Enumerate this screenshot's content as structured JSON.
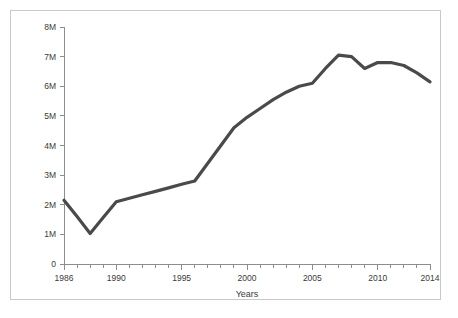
{
  "figure": {
    "background_color": "#ffffff",
    "frame_color": "#c9c9c9",
    "axis_color": "#8d8d8d"
  },
  "chart_data": {
    "type": "line",
    "title": "",
    "subtitle": "",
    "xlabel": "Years",
    "ylabel": "",
    "xlim": [
      1986,
      2014
    ],
    "ylim": [
      0,
      8000000
    ],
    "grid": false,
    "legend": "none",
    "line_color": "#4a4a4a",
    "line_width": 3.2,
    "x_tick_labels": [
      "1986",
      "1990",
      "1995",
      "2000",
      "2005",
      "2010",
      "2014"
    ],
    "x_tick_label_values": [
      1986,
      1990,
      1995,
      2000,
      2005,
      2010,
      2014
    ],
    "x_minor_ticks_every": 1,
    "y_tick_labels": [
      "0",
      "1M",
      "2M",
      "3M",
      "4M",
      "5M",
      "6M",
      "7M",
      "8M"
    ],
    "y_tick_values": [
      0,
      1000000,
      2000000,
      3000000,
      4000000,
      5000000,
      6000000,
      7000000,
      8000000
    ],
    "x": [
      1986,
      1987,
      1988,
      1989,
      1990,
      1991,
      1992,
      1993,
      1994,
      1995,
      1996,
      1997,
      1998,
      1999,
      2000,
      2001,
      2002,
      2003,
      2004,
      2005,
      2006,
      2007,
      2008,
      2009,
      2010,
      2011,
      2012,
      2013,
      2014
    ],
    "values": [
      2150000,
      1600000,
      1030000,
      1570000,
      2100000,
      2220000,
      2340000,
      2450000,
      2570000,
      2690000,
      2800000,
      3400000,
      4000000,
      4600000,
      4950000,
      5250000,
      5550000,
      5800000,
      6000000,
      6100000,
      6600000,
      7050000,
      7000000,
      6600000,
      6800000,
      6800000,
      6700000,
      6450000,
      6150000
    ],
    "series": [
      {
        "name": "Series 1",
        "color": "#4a4a4a",
        "values": [
          2150000,
          1600000,
          1030000,
          1570000,
          2100000,
          2220000,
          2340000,
          2450000,
          2570000,
          2690000,
          2800000,
          3400000,
          4000000,
          4600000,
          4950000,
          5250000,
          5550000,
          5800000,
          6000000,
          6100000,
          6600000,
          7050000,
          7000000,
          6600000,
          6800000,
          6800000,
          6700000,
          6450000,
          6150000
        ]
      }
    ]
  }
}
